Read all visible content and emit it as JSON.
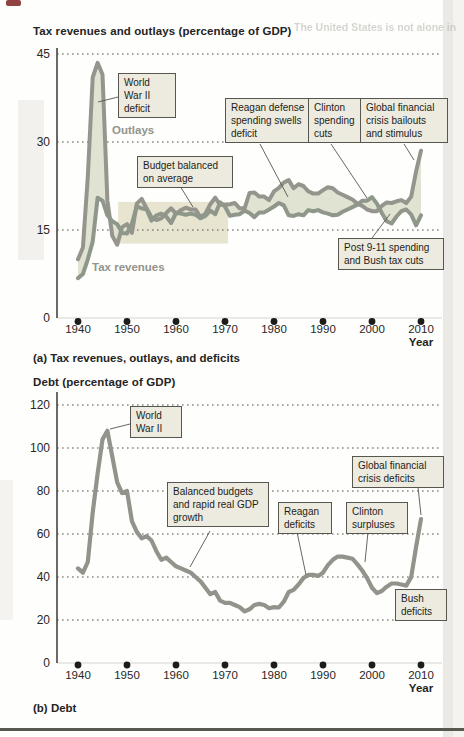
{
  "page": {
    "bleed_text": "The United States is not alone in"
  },
  "colors": {
    "annotation_box_bg": "#edebdf",
    "annotation_box_border": "#57564f",
    "grid_dots": "#6e6e68",
    "axis": "#454440",
    "tick_dot": "#1c1c1a",
    "deficit_fill": "#e0e3d2",
    "highlight_band": "#e7e4d0",
    "outlays_line": "#95958e",
    "revenues_line": "#8e978a",
    "debt_line": "#93938c"
  },
  "chart_data": [
    {
      "type": "line",
      "title": "Tax revenues and outlays (percentage of GDP)",
      "caption": "(a) Tax revenues, outlays, and deficits",
      "xlabel": "Year",
      "ylabel": "Tax revenues and outlays (percentage of GDP)",
      "ylim": [
        0,
        45
      ],
      "y_ticks": [
        45,
        30,
        15,
        0
      ],
      "x_ticks": [
        1940,
        1950,
        1960,
        1970,
        1980,
        1990,
        2000,
        2010
      ],
      "grid": "dotted horizontal",
      "legend_position": "on-chart labels",
      "x_start": 1940,
      "x_step": 1,
      "series": [
        {
          "name": "Outlays",
          "color": "#95958e",
          "values": [
            10,
            12,
            24,
            41,
            43.5,
            41.5,
            20,
            14,
            12.5,
            15.5,
            16,
            14.5,
            19.5,
            20.3,
            18.7,
            17.2,
            16.7,
            17,
            17.9,
            18.7,
            17.8,
            18.4,
            18.8,
            18.5,
            18.5,
            17.2,
            17.8,
            19.4,
            20.5,
            19.3,
            19.3,
            19.4,
            19.6,
            18.7,
            18.7,
            21.3,
            21.4,
            20.7,
            20.7,
            20.1,
            21.6,
            22.2,
            23.1,
            23.5,
            22.1,
            22.8,
            22.5,
            21.6,
            21.2,
            21.2,
            21.8,
            22.3,
            22.1,
            21.4,
            21,
            20.6,
            20.2,
            19.5,
            19.1,
            18.5,
            18.2,
            18.2,
            19.1,
            19.7,
            19.6,
            19.9,
            20.1,
            19.6,
            20.7,
            25,
            28.5
          ]
        },
        {
          "name": "Tax revenues",
          "color": "#8e978a",
          "values": [
            6.8,
            7.5,
            10,
            13,
            20.5,
            20,
            17.5,
            16.5,
            16,
            14.5,
            14.4,
            16.1,
            19,
            18.7,
            18.5,
            16.6,
            17.5,
            17.8,
            17.3,
            16.2,
            17.9,
            17.8,
            17.6,
            17.8,
            17.6,
            17,
            17.4,
            18.3,
            17.7,
            19.7,
            19,
            17.4,
            17.6,
            17.7,
            18.3,
            17.9,
            17.2,
            18,
            18,
            18.5,
            19,
            19.6,
            19.2,
            17.5,
            17.4,
            17.7,
            17.5,
            18.4,
            18.2,
            18.4,
            18,
            17.8,
            17.5,
            17.6,
            18.1,
            18.5,
            18.9,
            19.3,
            20,
            20,
            20.6,
            19.5,
            17.9,
            16.5,
            16.1,
            17.3,
            18.2,
            18.5,
            17.6,
            15.8,
            17.5
          ]
        }
      ],
      "fill_between": {
        "label": "deficit shading between outlays and tax revenues",
        "color": "#e0e3d2"
      },
      "highlight_band": {
        "x1": 1948.2,
        "x2": 1970.6,
        "y1": 12.7,
        "y2": 19.8,
        "color": "#e7e4d0"
      },
      "annotations": [
        {
          "text": "World\nWar II\ndeficit",
          "target_year": 1944,
          "target_value": 38
        },
        {
          "text": "Budget balanced\non average",
          "target_year": 1959,
          "target_value": 17
        },
        {
          "text": "Reagan defense\nspending swells\ndeficit",
          "target_year": 1983,
          "target_value": 20.5
        },
        {
          "text": "Clinton\nspending\ncuts",
          "target_year": 1999,
          "target_value": 20.3
        },
        {
          "text": "Global financial\ncrisis bailouts\nand stimulus",
          "target_year": 2010,
          "target_value": 27.5
        },
        {
          "text": "Post 9-11 spending\nand Bush tax cuts",
          "target_year": 2004,
          "target_value": 17.5
        }
      ]
    },
    {
      "type": "line",
      "title": "Debt (percentage of GDP)",
      "caption": "(b) Debt",
      "xlabel": "Year",
      "ylabel": "Debt (percentage of GDP)",
      "ylim": [
        0,
        120
      ],
      "y_ticks": [
        120,
        100,
        80,
        60,
        40,
        20,
        0
      ],
      "x_ticks": [
        1940,
        1950,
        1960,
        1970,
        1980,
        1990,
        2000,
        2010
      ],
      "grid": "dotted horizontal",
      "x_start": 1940,
      "x_step": 1,
      "series": [
        {
          "name": "Debt",
          "color": "#93938c",
          "values": [
            44,
            42,
            47,
            70,
            88,
            104,
            108,
            96,
            84,
            79,
            80,
            66,
            61,
            58,
            59,
            57,
            52,
            48,
            49,
            47,
            45,
            44,
            43,
            42,
            40,
            38,
            35,
            32,
            33,
            29,
            28,
            28,
            27,
            26,
            24,
            25,
            27,
            27.5,
            27,
            25.5,
            26,
            25.8,
            28.5,
            33,
            34,
            36.5,
            39.5,
            41,
            41,
            40.5,
            42,
            45.5,
            48,
            49.5,
            49.5,
            49,
            48.5,
            46,
            43,
            39.5,
            35,
            32.5,
            33.5,
            35.5,
            37,
            37,
            36.5,
            36,
            40,
            54,
            67
          ]
        }
      ],
      "annotations": [
        {
          "text": "World\nWar II",
          "target_year": 1946,
          "target_value": 108
        },
        {
          "text": "Global financial\ncrisis deficits",
          "target_year": 2010,
          "target_value": 67
        },
        {
          "text": "Balanced budgets\nand rapid real GDP\ngrowth",
          "target_year": 1963,
          "target_value": 42
        },
        {
          "text": "Reagan\ndeficits",
          "target_year": 1987,
          "target_value": 41
        },
        {
          "text": "Clinton\nsurpluses",
          "target_year": 1997,
          "target_value": 46
        },
        {
          "text": "Bush\ndeficits",
          "target_year": 2005,
          "target_value": 37
        }
      ]
    }
  ]
}
